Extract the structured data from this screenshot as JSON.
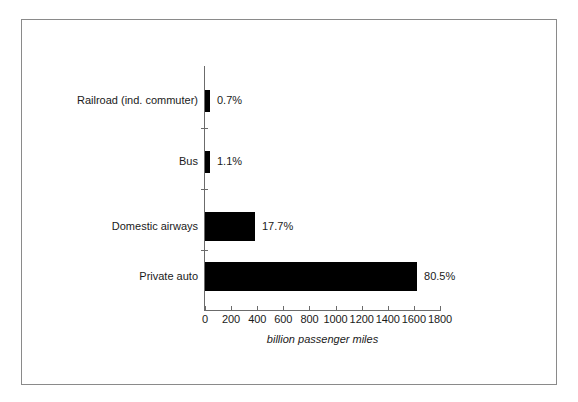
{
  "chart_data": {
    "type": "bar",
    "orientation": "horizontal",
    "title": "",
    "xlabel": "billion passenger miles",
    "ylabel": "",
    "xlim": [
      0,
      1800
    ],
    "xticks": [
      0,
      200,
      400,
      600,
      800,
      1000,
      1200,
      1400,
      1600,
      1800
    ],
    "xtick_labels": [
      "0",
      "200",
      "400",
      "600",
      "800",
      "1000",
      "1200",
      "1400",
      "1600",
      "1800"
    ],
    "grid": false,
    "legend": false,
    "bar_color": "#000000",
    "categories": [
      "Railroad (ind. commuter)",
      "Bus",
      "Domestic airways",
      "Private auto"
    ],
    "values": [
      14,
      22,
      383,
      1624
    ],
    "data_labels": [
      "0.7%",
      "1.1%",
      "17.7%",
      "80.5%"
    ],
    "series": [
      {
        "name": "billion passenger miles",
        "points": [
          {
            "category": "Railroad (ind. commuter)",
            "value": 14,
            "label": "0.7%"
          },
          {
            "category": "Bus",
            "value": 22,
            "label": "1.1%"
          },
          {
            "category": "Domestic airways",
            "value": 383,
            "label": "17.7%"
          },
          {
            "category": "Private auto",
            "value": 1624,
            "label": "80.5%"
          }
        ]
      }
    ]
  },
  "figure": {
    "border_color": "#8a8a8a",
    "background": "#ffffff"
  }
}
